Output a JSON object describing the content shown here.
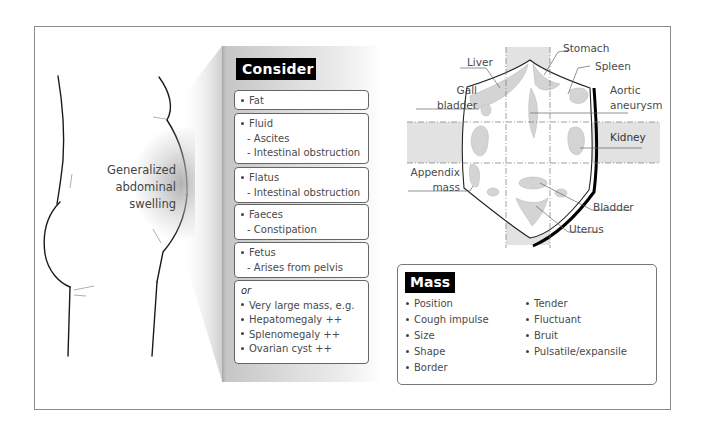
{
  "figure": {
    "swelling_label": [
      "Generalized",
      "abdominal",
      "swelling"
    ],
    "consider": {
      "title": "Consider",
      "groups": [
        {
          "lines": [
            {
              "text": "Fat",
              "type": "bullet"
            }
          ]
        },
        {
          "lines": [
            {
              "text": "Fluid",
              "type": "bullet"
            },
            {
              "text": "- Ascites",
              "type": "sub"
            },
            {
              "text": "- Intestinal obstruction",
              "type": "sub"
            }
          ]
        },
        {
          "lines": [
            {
              "text": "Flatus",
              "type": "bullet"
            },
            {
              "text": "- Intestinal obstruction",
              "type": "sub"
            }
          ]
        },
        {
          "lines": [
            {
              "text": "Faeces",
              "type": "bullet"
            },
            {
              "text": "- Constipation",
              "type": "sub"
            }
          ]
        },
        {
          "lines": [
            {
              "text": "Fetus",
              "type": "bullet"
            },
            {
              "text": "- Arises from pelvis",
              "type": "sub"
            }
          ]
        },
        {
          "lines": [
            {
              "text": "or",
              "type": "or"
            },
            {
              "text": "Very large mass, e.g.",
              "type": "bullet"
            },
            {
              "text": "Hepatomegaly ++",
              "type": "bullet"
            },
            {
              "text": "Splenomegaly ++",
              "type": "bullet"
            },
            {
              "text": "Ovarian cyst ++",
              "type": "bullet"
            }
          ]
        }
      ]
    },
    "anatomy_labels": {
      "liver": "Liver",
      "stomach": "Stomach",
      "spleen": "Spleen",
      "gall_bladder": [
        "Gall",
        "bladder"
      ],
      "aortic_aneurysm": [
        "Aortic",
        "aneurysm"
      ],
      "kidney": "Kidney",
      "appendix_mass": [
        "Appendix",
        "mass"
      ],
      "bladder": "Bladder",
      "uterus": "Uterus"
    },
    "mass": {
      "title": "Mass",
      "col1": [
        "Position",
        "Cough impulse",
        "Size",
        "Shape",
        "Border"
      ],
      "col2": [
        "Tender",
        "Fluctuant",
        "Bruit",
        "Pulsatile/expansile"
      ]
    }
  }
}
